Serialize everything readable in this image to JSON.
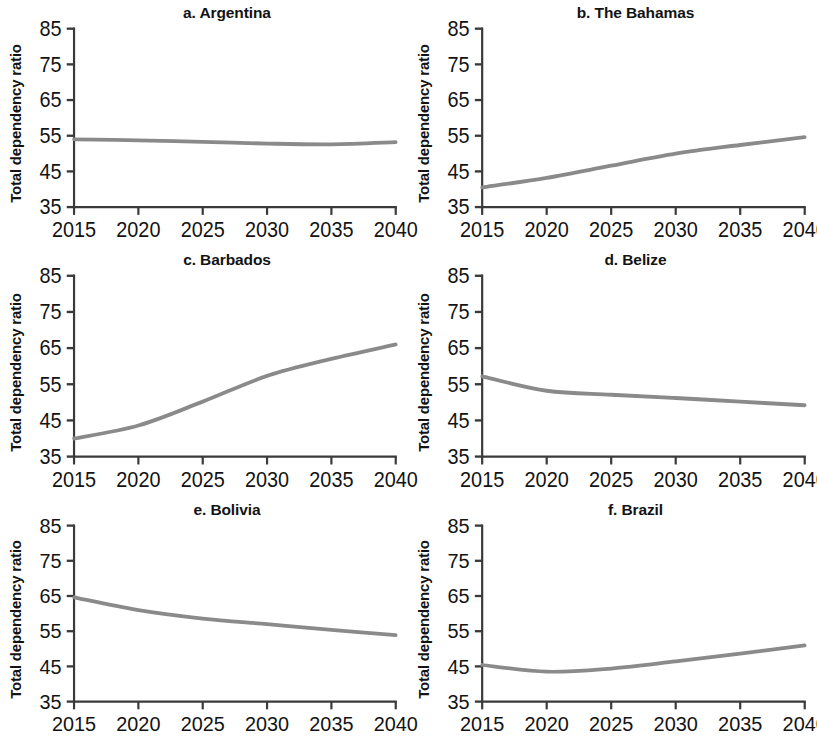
{
  "figure": {
    "background": "#ffffff",
    "line_color": "#8a8a8a",
    "axis_color": "#3a3a3a",
    "text_color": "#131313",
    "ylabel": "Total dependency ratio",
    "xtick_labels": [
      "2015",
      "2020",
      "2025",
      "2030",
      "2035",
      "2040"
    ],
    "ytick_labels": [
      "85",
      "75",
      "65",
      "55",
      "45",
      "35"
    ]
  },
  "chart_data": [
    {
      "type": "line",
      "title": "a. Argentina",
      "xlabel": "",
      "ylabel": "Total dependency ratio",
      "x": [
        2015,
        2020,
        2025,
        2030,
        2035,
        2040
      ],
      "xlim": [
        2015,
        2040
      ],
      "ylim": [
        35,
        85
      ],
      "yticks": [
        35,
        45,
        55,
        65,
        75,
        85
      ],
      "xticks": [
        2015,
        2020,
        2025,
        2030,
        2035,
        2040
      ],
      "grid": false,
      "legend": "none",
      "values": [
        54.0,
        53.7,
        53.3,
        52.8,
        52.6,
        53.2
      ]
    },
    {
      "type": "line",
      "title": "b. The Bahamas",
      "xlabel": "",
      "ylabel": "Total dependency ratio",
      "x": [
        2015,
        2020,
        2025,
        2030,
        2035,
        2040
      ],
      "xlim": [
        2015,
        2040
      ],
      "ylim": [
        35,
        85
      ],
      "yticks": [
        35,
        45,
        55,
        65,
        75,
        85
      ],
      "xticks": [
        2015,
        2020,
        2025,
        2030,
        2035,
        2040
      ],
      "grid": false,
      "legend": "none",
      "values": [
        40.5,
        43.2,
        46.6,
        50.0,
        52.4,
        54.6
      ]
    },
    {
      "type": "line",
      "title": "c. Barbados",
      "xlabel": "",
      "ylabel": "Total dependency ratio",
      "x": [
        2015,
        2020,
        2025,
        2030,
        2035,
        2040
      ],
      "xlim": [
        2015,
        2040
      ],
      "ylim": [
        35,
        85
      ],
      "yticks": [
        35,
        45,
        55,
        65,
        75,
        85
      ],
      "xticks": [
        2015,
        2020,
        2025,
        2030,
        2035,
        2040
      ],
      "grid": false,
      "legend": "none",
      "values": [
        40.0,
        43.6,
        50.2,
        57.3,
        62.0,
        66.0
      ]
    },
    {
      "type": "line",
      "title": "d. Belize",
      "xlabel": "",
      "ylabel": "Total dependency ratio",
      "x": [
        2015,
        2020,
        2025,
        2030,
        2035,
        2040
      ],
      "xlim": [
        2015,
        2040
      ],
      "ylim": [
        35,
        85
      ],
      "yticks": [
        35,
        45,
        55,
        65,
        75,
        85
      ],
      "xticks": [
        2015,
        2020,
        2025,
        2030,
        2035,
        2040
      ],
      "grid": false,
      "legend": "none",
      "values": [
        57.2,
        53.2,
        52.1,
        51.2,
        50.2,
        49.2
      ]
    },
    {
      "type": "line",
      "title": "e. Bolivia",
      "xlabel": "",
      "ylabel": "Total dependency ratio",
      "x": [
        2015,
        2020,
        2025,
        2030,
        2035,
        2040
      ],
      "xlim": [
        2015,
        2040
      ],
      "ylim": [
        35,
        85
      ],
      "yticks": [
        35,
        45,
        55,
        65,
        75,
        85
      ],
      "xticks": [
        2015,
        2020,
        2025,
        2030,
        2035,
        2040
      ],
      "grid": false,
      "legend": "none",
      "values": [
        64.6,
        61.0,
        58.6,
        57.0,
        55.4,
        53.9
      ]
    },
    {
      "type": "line",
      "title": "f. Brazil",
      "xlabel": "",
      "ylabel": "Total dependency ratio",
      "x": [
        2015,
        2020,
        2025,
        2030,
        2035,
        2040
      ],
      "xlim": [
        2015,
        2040
      ],
      "ylim": [
        35,
        85
      ],
      "yticks": [
        35,
        45,
        55,
        65,
        75,
        85
      ],
      "xticks": [
        2015,
        2020,
        2025,
        2030,
        2035,
        2040
      ],
      "grid": false,
      "legend": "none",
      "values": [
        45.4,
        43.5,
        44.4,
        46.4,
        48.6,
        51.0
      ]
    }
  ]
}
